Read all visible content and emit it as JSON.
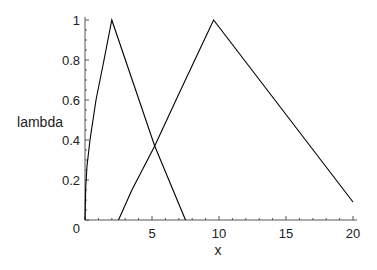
{
  "chart_data": {
    "type": "line",
    "title": "",
    "xlabel": "x",
    "ylabel": "lambda",
    "xlim": [
      0,
      20
    ],
    "ylim": [
      0,
      1
    ],
    "x_ticks": [
      0,
      5,
      10,
      15,
      20
    ],
    "x_tick_labels": [
      "0",
      "5",
      "10",
      "15",
      "20"
    ],
    "y_ticks": [
      0,
      0.2,
      0.4,
      0.6,
      0.8,
      1
    ],
    "y_tick_labels": [
      "0",
      "0.2",
      "0.4",
      "0.6",
      "0.8",
      "1"
    ],
    "grid": false,
    "legend": null,
    "series": [
      {
        "name": "membership 1",
        "color": "#000000",
        "points": [
          [
            0,
            0
          ],
          [
            0.05,
            0.16
          ],
          [
            0.15,
            0.27
          ],
          [
            0.37,
            0.4
          ],
          [
            0.82,
            0.6
          ],
          [
            1.42,
            0.8
          ],
          [
            2.0,
            1.0
          ],
          [
            5.2,
            0.37
          ],
          [
            7.5,
            0.0
          ]
        ]
      },
      {
        "name": "membership 2",
        "color": "#000000",
        "points": [
          [
            2.5,
            0.0
          ],
          [
            3.5,
            0.15
          ],
          [
            5.2,
            0.37
          ],
          [
            7.0,
            0.63
          ],
          [
            9.6,
            1.0
          ],
          [
            20,
            0.09
          ]
        ]
      }
    ]
  }
}
